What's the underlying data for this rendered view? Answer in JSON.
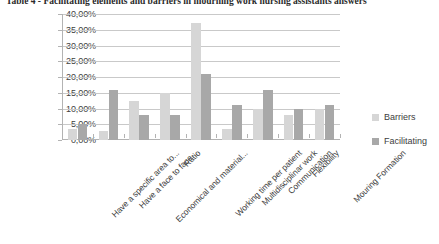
{
  "caption": "Table 4 - Facilitating elements and barriers in mourning work nursing assistants answers",
  "legend": {
    "items": [
      {
        "label": "Barriers",
        "color": "#d6d6d6",
        "icon": "legend-swatch"
      },
      {
        "label": "Facilitating",
        "color": "#a8a8a8",
        "icon": "legend-swatch"
      }
    ]
  },
  "axis": {
    "y_ticks": [
      "40,00%",
      "35,00%",
      "30,00%",
      "25,00%",
      "20,00%",
      "15,00%",
      "10,00%",
      "5,00%",
      "0,00%"
    ]
  },
  "chart_data": {
    "type": "bar",
    "title": "Table 4 - Facilitating elements and barriers in mourning work nursing assistants answers",
    "xlabel": "",
    "ylabel": "",
    "ylim": [
      0,
      40
    ],
    "ytick_values": [
      0,
      5,
      10,
      15,
      20,
      25,
      30,
      35,
      40
    ],
    "ytick_labels": [
      "0,00%",
      "5,00%",
      "10,00%",
      "15,00%",
      "20,00%",
      "25,00%",
      "30,00%",
      "35,00%",
      "40,00%"
    ],
    "grid": true,
    "legend_position": "right",
    "categories": [
      "Have a specific area to...",
      "Have a face to face...",
      "Economical and material...",
      "Ratio",
      "Working time per patient",
      "Multidisciplinar work",
      "Communication",
      "Flexibility",
      "Mouring Formation"
    ],
    "series": [
      {
        "name": "Barriers",
        "color": "#d6d6d6",
        "values": [
          3.5,
          3.0,
          12.5,
          15.0,
          37.0,
          3.5,
          10.0,
          8.0,
          10.0
        ]
      },
      {
        "name": "Facilitating",
        "color": "#a8a8a8",
        "values": [
          5.0,
          16.0,
          8.0,
          8.0,
          21.0,
          11.0,
          16.0,
          10.0,
          11.0
        ]
      }
    ]
  }
}
